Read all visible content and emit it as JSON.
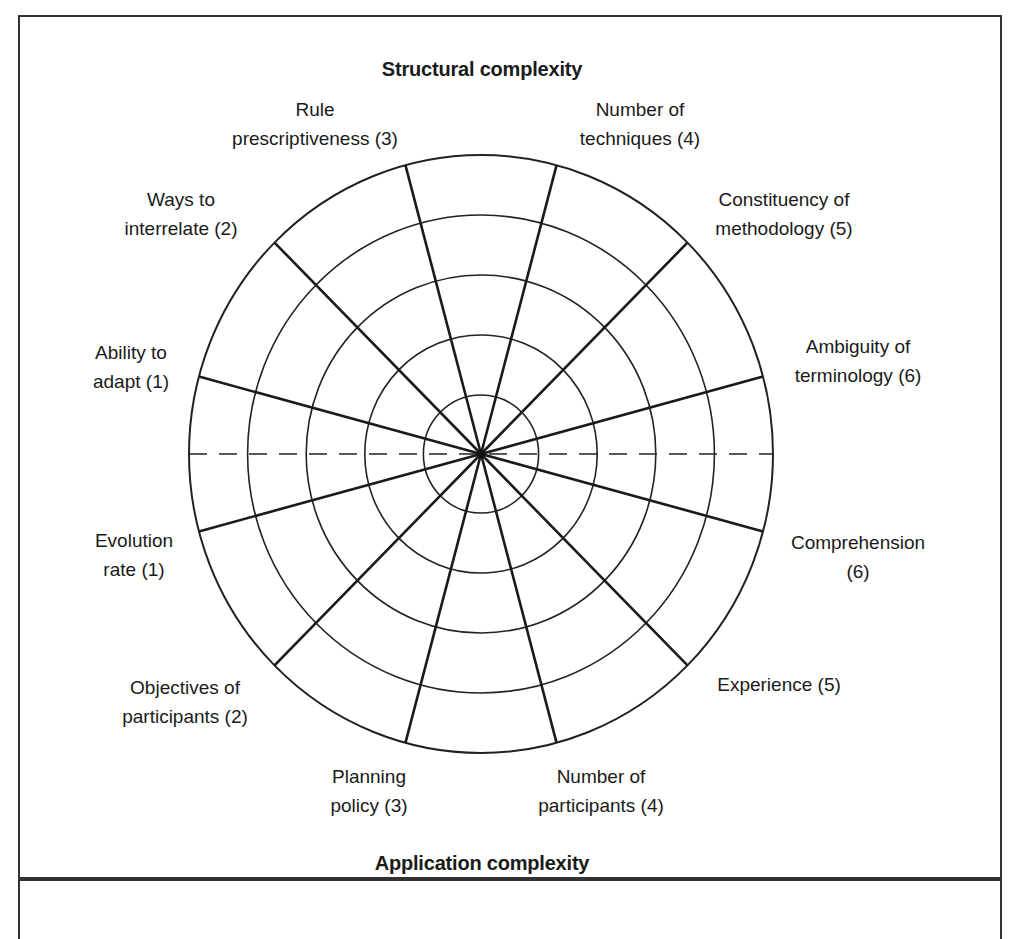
{
  "figure": {
    "top_heading": "Structural complexity",
    "bottom_heading": "Application complexity",
    "center": {
      "x": 481,
      "y": 454
    },
    "rings": [
      59,
      119,
      179,
      239,
      299
    ],
    "ring_count": 5,
    "spoke_angles_deg": [
      15,
      45,
      75,
      105,
      135,
      165,
      195,
      225,
      255,
      285,
      315,
      345
    ],
    "divider": "dashed horizontal line separating structural (top) and application (bottom) complexity",
    "structural_dimensions": [
      {
        "line1": "Ability to",
        "line2": "adapt (1)",
        "order": 1
      },
      {
        "line1": "Ways to",
        "line2": "interrelate (2)",
        "order": 2
      },
      {
        "line1": "Rule",
        "line2": "prescriptiveness (3)",
        "order": 3
      },
      {
        "line1": "Number of",
        "line2": "techniques (4)",
        "order": 4
      },
      {
        "line1": "Constituency of",
        "line2": "methodology (5)",
        "order": 5
      },
      {
        "line1": "Ambiguity of",
        "line2": "terminology (6)",
        "order": 6
      }
    ],
    "application_dimensions": [
      {
        "line1": "Evolution",
        "line2": "rate (1)",
        "order": 1
      },
      {
        "line1": "Objectives of",
        "line2": "participants (2)",
        "order": 2
      },
      {
        "line1": "Planning",
        "line2": "policy (3)",
        "order": 3
      },
      {
        "line1": "Number of",
        "line2": "participants (4)",
        "order": 4
      },
      {
        "line1": "Experience (5)",
        "line2": "",
        "order": 5
      },
      {
        "line1": "Comprehension",
        "line2": "(6)",
        "order": 6
      }
    ]
  }
}
